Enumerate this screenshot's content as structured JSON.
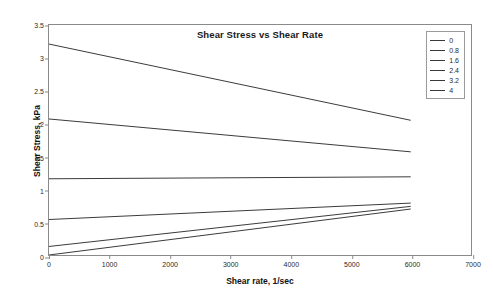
{
  "chart_data": {
    "type": "line",
    "title": "Shear Stress vs Shear Rate",
    "xlabel": "Shear rate, 1/sec",
    "ylabel": "Shear Stress, kPa",
    "xlim": [
      0,
      7000
    ],
    "ylim": [
      0,
      3.5
    ],
    "xticks": [
      0,
      1000,
      2000,
      3000,
      4000,
      5000,
      6000,
      7000
    ],
    "yticks": [
      0,
      0.5,
      1,
      1.5,
      2,
      2.5,
      3,
      3.5
    ],
    "grid": false,
    "legend_position": "top-right",
    "legend_title": "",
    "line_color": "#3a3a3a",
    "x": [
      0,
      6000
    ],
    "series": [
      {
        "name": "0",
        "values": [
          3.21,
          2.05
        ]
      },
      {
        "name": "0.8",
        "values": [
          2.07,
          1.57
        ]
      },
      {
        "name": "1.6",
        "values": [
          1.16,
          1.19
        ]
      },
      {
        "name": "2.4",
        "values": [
          0.54,
          0.79
        ]
      },
      {
        "name": "3.2",
        "values": [
          0.13,
          0.74
        ]
      },
      {
        "name": "4",
        "values": [
          0.0,
          0.7
        ]
      }
    ]
  },
  "axis": {
    "ytick_labels": [
      "0",
      "0.5",
      "1",
      "1.5",
      "2",
      "2.5",
      "3",
      "3.5"
    ],
    "xtick_labels": [
      "0",
      "1000",
      "2000",
      "3000",
      "4000",
      "5000",
      "6000",
      "7000"
    ]
  }
}
